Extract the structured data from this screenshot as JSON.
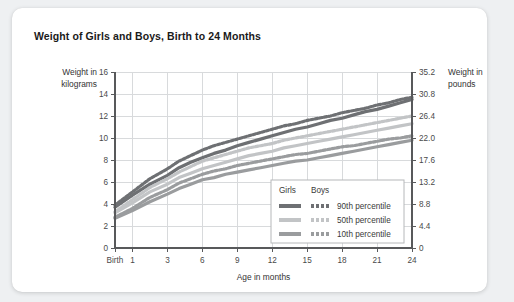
{
  "card": {
    "title": "Weight of Girls and Boys, Birth to 24 Months"
  },
  "axes": {
    "left_title_line1": "Weight in",
    "left_title_line2": "kilograms",
    "right_title_line1": "Weight in",
    "right_title_line2": "pounds",
    "xlabel": "Age in months"
  },
  "legend": {
    "col1_header": "Girls",
    "col2_header": "Boys",
    "rows": [
      {
        "label": "90th percentile",
        "color": "#6e7073"
      },
      {
        "label": "50th percentile",
        "color": "#c2c4c6"
      },
      {
        "label": "10th percentile",
        "color": "#9a9c9e"
      }
    ]
  },
  "colors": {
    "page_background": "#eef0f2",
    "card_background": "#ffffff",
    "grid": "#d8dadc",
    "axis": "#58595b",
    "p90": "#6e7073",
    "p50": "#c2c4c6",
    "p10": "#9a9c9e"
  },
  "chart_data": {
    "type": "line",
    "title": "Weight of Girls and Boys, Birth to 24 Months",
    "xlabel": "Age in months",
    "ylabel": "Weight in kilograms",
    "y2label": "Weight in pounds",
    "grid": true,
    "legend_position": "inside-bottom-right",
    "xlim": [
      0,
      24
    ],
    "ylim": [
      0,
      16
    ],
    "y2lim": [
      0,
      35.2
    ],
    "xticks": [
      0,
      1,
      3,
      6,
      9,
      12,
      15,
      18,
      21,
      24
    ],
    "xtick_labels": [
      "Birth",
      "1",
      "3",
      "6",
      "9",
      "12",
      "15",
      "18",
      "21",
      "24"
    ],
    "yticks": [
      0,
      2,
      4,
      6,
      8,
      10,
      12,
      14,
      16
    ],
    "ytick_labels": [
      "0",
      "2",
      "4",
      "6",
      "8",
      "10",
      "12",
      "14",
      "16"
    ],
    "y2ticks": [
      0,
      4.4,
      8.8,
      13.2,
      17.6,
      22.0,
      26.4,
      30.8,
      35.2
    ],
    "y2tick_labels": [
      "0",
      "4.4",
      "8.8",
      "13.2",
      "17.6",
      "22.0",
      "26.4",
      "30.8",
      "35.2"
    ],
    "x": [
      0,
      1,
      2,
      3,
      4,
      5,
      6,
      7,
      8,
      9,
      10,
      11,
      12,
      13,
      14,
      15,
      16,
      17,
      18,
      19,
      20,
      21,
      22,
      23,
      24
    ],
    "series": [
      {
        "name": "Boys 90th percentile",
        "sex": "Boys",
        "percentile": "90th",
        "color": "#6e7073",
        "dashed": true,
        "values": [
          3.9,
          5.1,
          6.3,
          7.2,
          7.9,
          8.4,
          8.9,
          9.3,
          9.6,
          9.9,
          10.2,
          10.5,
          10.8,
          11.1,
          11.3,
          11.6,
          11.8,
          12.0,
          12.3,
          12.5,
          12.7,
          13.0,
          13.2,
          13.5,
          13.7
        ]
      },
      {
        "name": "Girls 90th percentile",
        "sex": "Girls",
        "percentile": "90th",
        "color": "#6e7073",
        "dashed": false,
        "values": [
          3.7,
          4.8,
          5.8,
          6.6,
          7.3,
          7.8,
          8.2,
          8.6,
          8.9,
          9.3,
          9.6,
          9.9,
          10.2,
          10.5,
          10.8,
          11.0,
          11.3,
          11.6,
          11.8,
          12.1,
          12.4,
          12.6,
          12.9,
          13.2,
          13.5
        ]
      },
      {
        "name": "Boys 50th percentile",
        "sex": "Boys",
        "percentile": "50th",
        "color": "#c2c4c6",
        "dashed": true,
        "values": [
          3.3,
          4.4,
          5.5,
          6.3,
          6.9,
          7.4,
          7.9,
          8.2,
          8.5,
          8.8,
          9.1,
          9.3,
          9.5,
          9.8,
          10.0,
          10.2,
          10.4,
          10.6,
          10.8,
          11.0,
          11.2,
          11.4,
          11.6,
          11.8,
          12.0
        ]
      },
      {
        "name": "Girls 50th percentile",
        "sex": "Girls",
        "percentile": "50th",
        "color": "#c2c4c6",
        "dashed": false,
        "values": [
          3.2,
          4.1,
          5.1,
          5.8,
          6.4,
          6.8,
          7.2,
          7.5,
          7.8,
          8.1,
          8.4,
          8.6,
          8.8,
          9.1,
          9.3,
          9.5,
          9.7,
          9.9,
          10.1,
          10.3,
          10.5,
          10.7,
          10.9,
          11.1,
          11.3
        ]
      },
      {
        "name": "Boys 10th percentile",
        "sex": "Boys",
        "percentile": "10th",
        "color": "#9a9c9e",
        "dashed": true,
        "values": [
          2.8,
          3.6,
          4.6,
          5.3,
          5.9,
          6.3,
          6.7,
          7.0,
          7.2,
          7.5,
          7.7,
          7.9,
          8.1,
          8.3,
          8.5,
          8.6,
          8.8,
          9.0,
          9.2,
          9.3,
          9.5,
          9.7,
          9.9,
          10.0,
          10.2
        ]
      },
      {
        "name": "Girls 10th percentile",
        "sex": "Girls",
        "percentile": "10th",
        "color": "#9a9c9e",
        "dashed": false,
        "values": [
          2.7,
          3.4,
          4.2,
          4.9,
          5.4,
          5.8,
          6.2,
          6.4,
          6.7,
          6.9,
          7.1,
          7.3,
          7.5,
          7.7,
          7.9,
          8.0,
          8.2,
          8.4,
          8.6,
          8.8,
          9.0,
          9.2,
          9.4,
          9.6,
          9.8
        ]
      }
    ]
  }
}
